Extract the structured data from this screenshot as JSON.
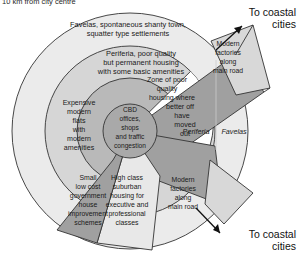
{
  "figure": {
    "top_note": "10 km from city centre",
    "type": "concentric-ring land use model"
  },
  "colors": {
    "outer_ring": "#ebebeb",
    "mid_ring": "#d6d6d6",
    "inner_ring": "#b9b9b9",
    "cbd_core": "#a9a9a9",
    "poor_zone": "#ffffff",
    "sector_dark": "#a0a0a0",
    "sector_light": "#e8e8e8",
    "stroke": "#333333",
    "text": "#1a1a1a"
  },
  "zones": {
    "outer": {
      "name": "favelas-zone",
      "lines": [
        "Favelas, spontaneous shanty town,",
        "squatter type settlements"
      ]
    },
    "middle": {
      "name": "periferia-zone",
      "lines": [
        "Periferia, poor quality",
        "but permanent housing",
        "with some basic amenities"
      ]
    },
    "poor_quality": {
      "name": "zone-of-poor-quality-housing",
      "lines": [
        "Zone of poor",
        "quality",
        "housing where",
        "better off",
        "have",
        "moved",
        "out"
      ]
    },
    "expensive_flats": {
      "name": "expensive-modern-flats-sector",
      "lines": [
        "Expensive",
        "modern",
        "flats",
        "with",
        "modern",
        "amenities"
      ]
    },
    "cbd": {
      "name": "cbd-core",
      "lines": [
        "CBD",
        "offices,",
        "shops",
        "and traffic",
        "congestion"
      ]
    },
    "gov_schemes": {
      "name": "government-improvement-schemes-sector",
      "lines": [
        "Small",
        "low cost",
        "government",
        "house",
        "improvement",
        "schemes"
      ]
    },
    "high_class": {
      "name": "high-class-suburban-sector",
      "lines": [
        "High class",
        "suburban",
        "housing for",
        "executive and",
        "professional",
        "classes"
      ]
    },
    "factories_top": {
      "name": "modern-factories-top-sector",
      "lines": [
        "Modern",
        "factories",
        "along",
        "main road"
      ]
    },
    "factories_bottom": {
      "name": "modern-factories-bottom-sector",
      "lines": [
        "Modern",
        "factories",
        "along",
        "main road"
      ]
    }
  },
  "ring_labels": {
    "periferia": "Periferia",
    "favelas": "Favelas"
  },
  "arrows": {
    "top_label_line1": "To coastal",
    "top_label_line2": "cities",
    "bottom_label_line1": "To coastal",
    "bottom_label_line2": "cities"
  }
}
